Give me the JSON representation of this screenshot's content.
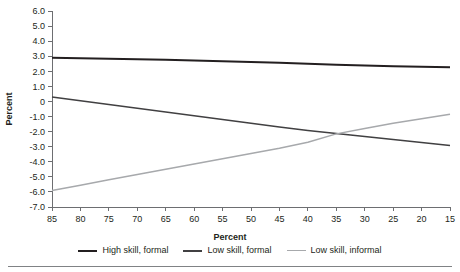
{
  "chart_data": {
    "type": "line",
    "title": "",
    "xlabel": "Percent",
    "ylabel": "Percent",
    "xlim": [
      85,
      15
    ],
    "ylim": [
      -7.0,
      6.0
    ],
    "x_reversed": true,
    "grid": false,
    "legend_position": "bottom",
    "x": [
      85,
      80,
      75,
      70,
      65,
      60,
      55,
      50,
      45,
      40,
      35,
      30,
      25,
      20,
      15
    ],
    "x_tick_labels": [
      "85",
      "80",
      "75",
      "70",
      "65",
      "60",
      "55",
      "50",
      "45",
      "40",
      "35",
      "30",
      "25",
      "20",
      "15"
    ],
    "y_tick_labels": [
      "6.0",
      "5.0",
      "4.0",
      "3.0",
      "2.0",
      "1.0",
      "0",
      "-1.0",
      "-2.0",
      "-3.0",
      "-4.0",
      "-5.0",
      "-6.0",
      "-7.0"
    ],
    "y_ticks": [
      6.0,
      5.0,
      4.0,
      3.0,
      2.0,
      1.0,
      0,
      -1.0,
      -2.0,
      -3.0,
      -4.0,
      -5.0,
      -6.0,
      -7.0
    ],
    "series": [
      {
        "name": "High skill, formal",
        "color": "#231f20",
        "width": 2.0,
        "values": [
          2.9,
          2.87,
          2.83,
          2.8,
          2.76,
          2.72,
          2.67,
          2.62,
          2.56,
          2.5,
          2.44,
          2.38,
          2.33,
          2.3,
          2.27
        ]
      },
      {
        "name": "Low skill, formal",
        "color": "#414042",
        "width": 1.5,
        "values": [
          0.3,
          0.05,
          -0.2,
          -0.45,
          -0.7,
          -0.95,
          -1.2,
          -1.45,
          -1.7,
          -1.92,
          -2.12,
          -2.32,
          -2.52,
          -2.72,
          -2.92
        ]
      },
      {
        "name": "Low skill, informal",
        "color": "#a7a9ac",
        "width": 1.5,
        "values": [
          -5.9,
          -5.55,
          -5.2,
          -4.85,
          -4.5,
          -4.15,
          -3.8,
          -3.45,
          -3.1,
          -2.7,
          -2.15,
          -1.8,
          -1.45,
          -1.15,
          -0.85
        ]
      }
    ],
    "annotations": []
  },
  "legend": {
    "items": [
      {
        "label": "High skill, formal",
        "color": "#231f20",
        "thickness": "2px"
      },
      {
        "label": "Low skill, formal",
        "color": "#414042",
        "thickness": "2px"
      },
      {
        "label": "Low skill, informal",
        "color": "#a7a9ac",
        "thickness": "1.5px"
      }
    ]
  },
  "axes": {
    "x_title": "Percent",
    "y_title": "Percent"
  }
}
